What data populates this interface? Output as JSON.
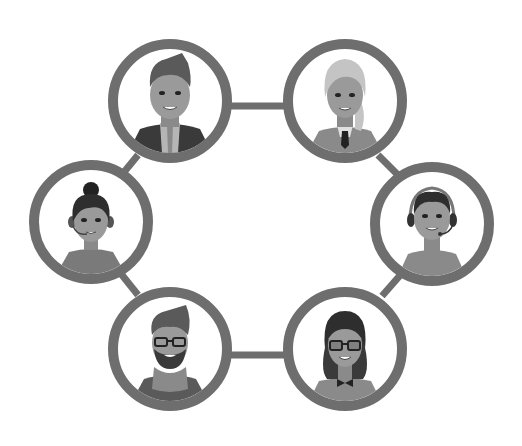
{
  "title": "Team network",
  "colors": {
    "ring": "#6e6e6e",
    "background": "#ffffff",
    "skin": "#9a9a9a",
    "skin_shade": "#8a8a8a",
    "hair_dark": "#2e2e2e",
    "hair_mid": "#5a5a5a",
    "hair_light": "#c4c4c4",
    "clothing_dark": "#3a3a3a",
    "clothing_mid": "#7a7a7a",
    "clothing_light": "#b5b5b5"
  },
  "nodes": [
    {
      "id": "man-suit",
      "label": "Man with quiff in dark jacket",
      "cx": 170,
      "cy": 101
    },
    {
      "id": "woman-blonde-tie",
      "label": "Blonde woman with tie",
      "cx": 345,
      "cy": 101
    },
    {
      "id": "woman-bun-headset",
      "label": "Woman with bun and headset",
      "cx": 91,
      "cy": 222
    },
    {
      "id": "man-headset",
      "label": "Man with headset",
      "cx": 432,
      "cy": 224
    },
    {
      "id": "man-beard-glasses",
      "label": "Bearded man with glasses and scarf",
      "cx": 170,
      "cy": 349
    },
    {
      "id": "woman-glasses-bowtie",
      "label": "Woman with glasses and bow tie",
      "cx": 345,
      "cy": 349
    }
  ]
}
